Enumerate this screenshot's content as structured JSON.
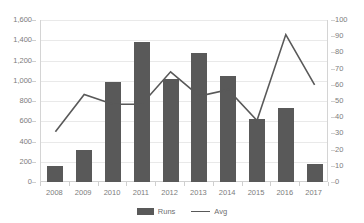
{
  "chart_data": {
    "type": "bar",
    "title": "",
    "xlabel": "",
    "ylabel": "",
    "grid": true,
    "legend_position": "bottom",
    "categories": [
      "2008",
      "2009",
      "2010",
      "2011",
      "2012",
      "2013",
      "2014",
      "2015",
      "2016",
      "2017"
    ],
    "series": [
      {
        "name": "Runs",
        "type": "bar",
        "axis": "left",
        "color": "#595959",
        "values": [
          160,
          320,
          990,
          1380,
          1020,
          1270,
          1050,
          620,
          735,
          180
        ]
      },
      {
        "name": "Avg",
        "type": "line",
        "axis": "right",
        "color": "#595959",
        "values": [
          31,
          54,
          48,
          48,
          68,
          53,
          57,
          38,
          91,
          60
        ]
      }
    ],
    "ylim": [
      0,
      1600
    ],
    "y2lim": [
      0,
      100
    ],
    "yticks": [
      "0",
      "200",
      "400",
      "600",
      "800",
      "1,000",
      "1,200",
      "1,400",
      "1,600"
    ],
    "ytick_values": [
      0,
      200,
      400,
      600,
      800,
      1000,
      1200,
      1400,
      1600
    ],
    "y2ticks": [
      "0",
      "10",
      "20",
      "30",
      "40",
      "50",
      "60",
      "70",
      "80",
      "90",
      "100"
    ],
    "y2tick_values": [
      0,
      10,
      20,
      30,
      40,
      50,
      60,
      70,
      80,
      90,
      100
    ]
  },
  "legend": {
    "items": [
      {
        "label": "Runs",
        "marker": "bar-swatch-icon"
      },
      {
        "label": "Avg",
        "marker": "line-swatch-icon"
      }
    ]
  }
}
